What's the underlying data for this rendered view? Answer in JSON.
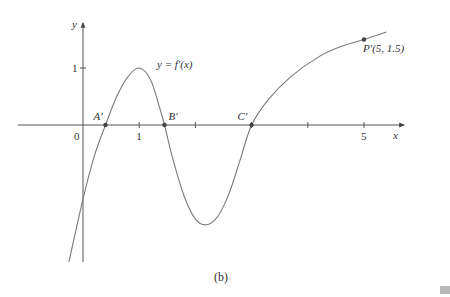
{
  "caption": "(b)",
  "colors": {
    "axis": "#555555",
    "curve": "#7a7a7a",
    "point": "#444444",
    "text": "#333333",
    "marker": "#b8b8b8"
  },
  "chart_data": {
    "type": "line",
    "title": "",
    "caption": "(b)",
    "xlabel": "x",
    "ylabel": "y",
    "curve_label": "y = f′(x)",
    "x_ticks": [
      1,
      2,
      3,
      4,
      5
    ],
    "x_tick_labels": [
      {
        "value": 0,
        "label": "0"
      },
      {
        "value": 1,
        "label": "1"
      },
      {
        "value": 5,
        "label": "5"
      }
    ],
    "y_ticks": [
      1
    ],
    "y_tick_labels": [
      {
        "value": 1,
        "label": "1"
      }
    ],
    "xlim": [
      -1.3,
      5.9
    ],
    "ylim": [
      -2.4,
      2.0
    ],
    "grid": false,
    "series": [
      {
        "name": "f'(x)",
        "points": [
          [
            -0.25,
            -2.4
          ],
          [
            0.0,
            -1.3
          ],
          [
            0.2,
            -0.55
          ],
          [
            0.4,
            0.0
          ],
          [
            0.6,
            0.5
          ],
          [
            0.8,
            0.85
          ],
          [
            1.0,
            1.0
          ],
          [
            1.2,
            0.8
          ],
          [
            1.35,
            0.35
          ],
          [
            1.45,
            0.0
          ],
          [
            1.6,
            -0.6
          ],
          [
            1.8,
            -1.25
          ],
          [
            2.0,
            -1.65
          ],
          [
            2.2,
            -1.75
          ],
          [
            2.4,
            -1.6
          ],
          [
            2.6,
            -1.2
          ],
          [
            2.8,
            -0.6
          ],
          [
            3.0,
            0.0
          ],
          [
            3.3,
            0.45
          ],
          [
            3.7,
            0.85
          ],
          [
            4.2,
            1.2
          ],
          [
            4.6,
            1.38
          ],
          [
            5.0,
            1.5
          ],
          [
            5.4,
            1.63
          ]
        ]
      }
    ],
    "annotations": [
      {
        "label": "A′",
        "x": 0.4,
        "y": 0
      },
      {
        "label": "B′",
        "x": 1.45,
        "y": 0
      },
      {
        "label": "C′",
        "x": 3.0,
        "y": 0
      },
      {
        "label": "P′(5, 1.5)",
        "x": 5,
        "y": 1.5
      }
    ]
  }
}
